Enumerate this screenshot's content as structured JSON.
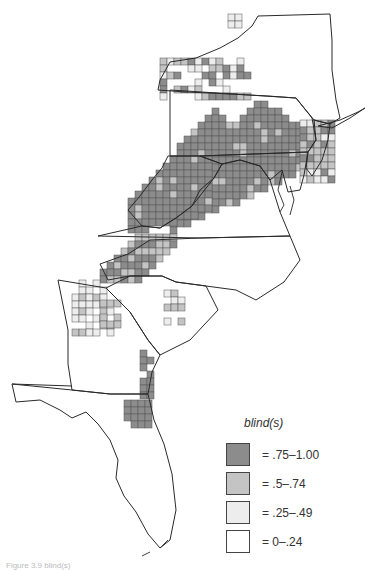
{
  "figure": {
    "type": "choropleth grid map",
    "region": "Eastern United States (New York to Florida)",
    "caption": "Figure 3.9  blind(s)"
  },
  "legend": {
    "title": "blind(s)",
    "items": [
      {
        "label": "= .75–1.00",
        "color": "#8c8c8c"
      },
      {
        "label": "= .5–.74",
        "color": "#c4c4c4"
      },
      {
        "label": "= .25–.49",
        "color": "#ededed"
      },
      {
        "label": "= 0–.24",
        "color": "#ffffff"
      }
    ]
  },
  "map": {
    "cell_size": 7,
    "cell_stroke": "#555555",
    "outline_color": "#2a2a2a",
    "regions": [
      {
        "name": "PA/MD/WV core",
        "class": ".75–1.00"
      },
      {
        "name": "NJ/DE fringe",
        "class": ".5–.74"
      },
      {
        "name": "Western NY",
        "class": ".25–.49"
      },
      {
        "name": "Appalachian VA/NC",
        "class": ".5–.74"
      },
      {
        "name": "North GA / SC upstate",
        "class": ".25–.49"
      },
      {
        "name": "Coastal GA / NE Florida",
        "class": ".75–1.00"
      }
    ]
  }
}
